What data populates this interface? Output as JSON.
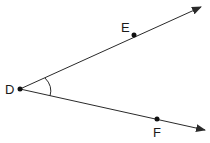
{
  "diagram": {
    "type": "angle",
    "vertex": {
      "label": "D",
      "x": 20,
      "y": 89
    },
    "rays": [
      {
        "name": "ray-DE",
        "point_label": "E",
        "point": {
          "x": 134,
          "y": 35
        },
        "end": {
          "x": 202,
          "y": 6
        }
      },
      {
        "name": "ray-DF",
        "point_label": "F",
        "point": {
          "x": 157,
          "y": 119
        },
        "end": {
          "x": 206,
          "y": 130
        }
      }
    ],
    "angle_mark": "arc",
    "labels": {
      "D": "D",
      "E": "E",
      "F": "F"
    },
    "colors": {
      "stroke": "#2a2a2a",
      "text": "#1a1a1a",
      "background": "#ffffff"
    }
  }
}
